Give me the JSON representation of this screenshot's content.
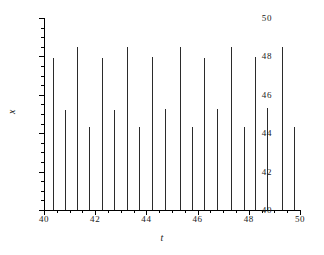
{
  "chart_data": {
    "type": "line",
    "subtype": "impulse-spike-train",
    "title": "",
    "xlabel": "t",
    "ylabel": "x",
    "xlim": [
      40,
      50
    ],
    "ylim": [
      40,
      50
    ],
    "grid": false,
    "legend": null,
    "x_ticks": [
      40,
      42,
      44,
      46,
      48,
      50
    ],
    "x_tick_labels": [
      "40",
      "42",
      "44",
      "46",
      "48",
      "50"
    ],
    "x_minor_tick_step": 0.5,
    "y_ticks": [
      40,
      42,
      44,
      46,
      48,
      50
    ],
    "y_tick_labels": [
      "40",
      "42",
      "44",
      "46",
      "48",
      "50"
    ],
    "y_minor_tick_step": 0.5,
    "baseline": 40,
    "series": [
      {
        "name": "x(t)",
        "color": "#2b2b2b",
        "x": [
          40.35,
          40.82,
          41.3,
          41.77,
          42.25,
          42.72,
          43.25,
          43.72,
          44.2,
          44.72,
          45.3,
          45.77,
          46.25,
          46.77,
          47.3,
          47.8,
          48.25,
          48.72,
          49.28,
          49.78
        ],
        "values": [
          47.9,
          45.2,
          48.5,
          44.3,
          47.9,
          45.2,
          48.5,
          44.3,
          47.95,
          45.25,
          48.5,
          44.3,
          47.9,
          45.25,
          48.5,
          44.3,
          47.95,
          45.3,
          48.5,
          44.3
        ]
      }
    ]
  },
  "axes": {
    "ylabel_text": "x",
    "xlabel_text": "t"
  }
}
